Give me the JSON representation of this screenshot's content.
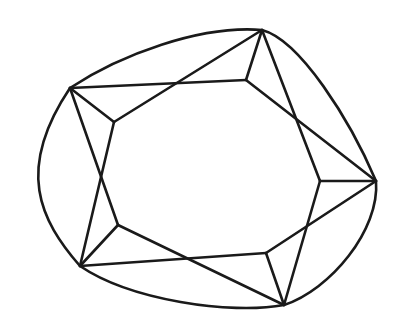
{
  "diagram": {
    "type": "line-drawing",
    "stroke_color": "#1a1a1a",
    "background_color": "#ffffff",
    "outer_vertices": {
      "A": [
        70,
        88
      ],
      "B": [
        262,
        30
      ],
      "C": [
        376,
        181
      ],
      "D": [
        284,
        305
      ],
      "E": [
        80,
        266
      ]
    },
    "inner_vertices": {
      "a": [
        114,
        122
      ],
      "b": [
        246,
        80
      ],
      "c": [
        320,
        181
      ],
      "d": [
        266,
        253
      ],
      "e": [
        118,
        225
      ]
    },
    "outline_path": "M70,88 C120,55 200,25 262,30 C300,40 350,120 376,181 C380,230 330,290 284,305 C230,315 130,300 80,266 C40,220 15,170 70,88 Z",
    "edges": [
      [
        "A",
        "b"
      ],
      [
        "A",
        "a"
      ],
      [
        "A",
        "e"
      ],
      [
        "B",
        "a"
      ],
      [
        "B",
        "b"
      ],
      [
        "B",
        "c"
      ],
      [
        "C",
        "c"
      ],
      [
        "C",
        "b"
      ],
      [
        "C",
        "d"
      ],
      [
        "D",
        "d"
      ],
      [
        "D",
        "c"
      ],
      [
        "D",
        "e"
      ],
      [
        "E",
        "e"
      ],
      [
        "E",
        "a"
      ],
      [
        "E",
        "d"
      ]
    ]
  }
}
